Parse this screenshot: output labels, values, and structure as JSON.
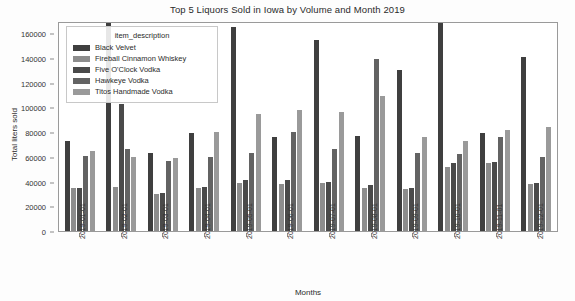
{
  "chart_data": {
    "type": "bar",
    "title": "Top 5 Liquors Sold in Iowa by Volume and Month 2019",
    "xlabel": "Months",
    "ylabel": "Total liters sold",
    "ylim": [
      0,
      170000
    ],
    "yticks": [
      0,
      20000,
      40000,
      60000,
      80000,
      100000,
      120000,
      140000,
      160000
    ],
    "ytick_labels": [
      "0",
      "20000",
      "40000",
      "60000",
      "80000",
      "100000",
      "120000",
      "140000",
      "160000"
    ],
    "grid": false,
    "legend_position": "upper left",
    "legend_title": "item_description",
    "categories": [
      "2019-01-01",
      "2019-02-01",
      "2019-03-01",
      "2019-04-01",
      "2019-05-01",
      "2019-06-01",
      "2019-07-01",
      "2019-08-01",
      "2019-09-01",
      "2019-10-01",
      "2019-11-01",
      "2019-12-01"
    ],
    "series": [
      {
        "name": "Black Velvet",
        "color": "#3f3f3f",
        "values": [
          73000,
          168000,
          63000,
          79000,
          165000,
          76000,
          155000,
          77000,
          130000,
          169000,
          79000,
          141000
        ]
      },
      {
        "name": "Fireball Cinnamon Whiskey",
        "color": "#8d8d8d",
        "values": [
          35000,
          36000,
          30000,
          35000,
          39000,
          38000,
          39000,
          35000,
          34000,
          52000,
          55000,
          38000
        ]
      },
      {
        "name": "Five O'Clock Vodka",
        "color": "#4a4a4a",
        "values": [
          35000,
          103000,
          31000,
          36000,
          41000,
          41000,
          40000,
          37000,
          35000,
          55000,
          56000,
          39000
        ]
      },
      {
        "name": "Hawkeye Vodka",
        "color": "#636363",
        "values": [
          61000,
          66000,
          57000,
          60000,
          63000,
          80000,
          66000,
          139000,
          63000,
          62000,
          76000,
          60000
        ]
      },
      {
        "name": "Titos Handmade Vodka",
        "color": "#9a9a9a",
        "values": [
          65000,
          60000,
          59000,
          80000,
          95000,
          98000,
          96000,
          109000,
          76000,
          73000,
          82000,
          84000
        ]
      }
    ]
  }
}
